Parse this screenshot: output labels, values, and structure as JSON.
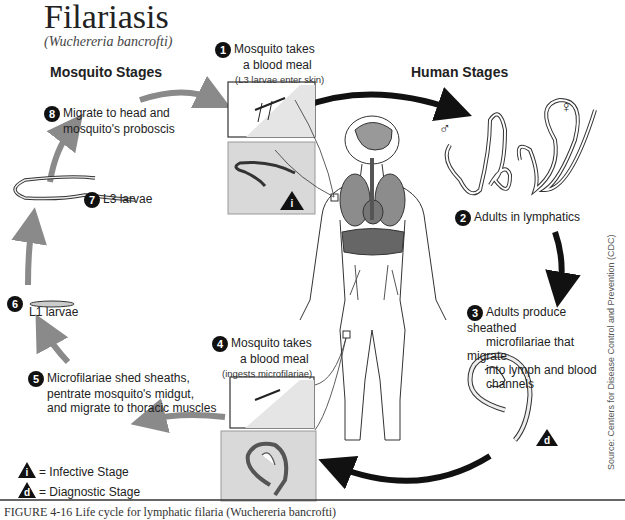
{
  "header": {
    "title": "Filariasis",
    "subtitle": "(Wuchereria bancrofti)"
  },
  "sections": {
    "mosquito": "Mosquito Stages",
    "human": "Human Stages"
  },
  "steps": [
    {
      "num": "1",
      "line1": "Mosquito takes",
      "line2": "a blood meal",
      "note": "(L3 larvae enter skin)"
    },
    {
      "num": "2",
      "line1": "Adults in lymphatics"
    },
    {
      "num": "3",
      "line1": "Adults produce sheathed",
      "line2": "microfilariae that migrate",
      "line3": "into lymph and blood",
      "line4": "channels"
    },
    {
      "num": "4",
      "line1": "Mosquito takes",
      "line2": "a blood meal",
      "note": "(ingests microfilariae)"
    },
    {
      "num": "5",
      "line1": "Microfilariae shed sheaths,",
      "line2": "pentrate mosquito's midgut,",
      "line3": "and migrate to thoracic muscles"
    },
    {
      "num": "6",
      "line1": "L1 larvae"
    },
    {
      "num": "7",
      "line1": "L3 larvae"
    },
    {
      "num": "8",
      "line1": "Migrate to head and",
      "line2": "mosquito's proboscis"
    }
  ],
  "legend": {
    "infective_symbol": "i",
    "infective_label": "= Infective Stage",
    "diagnostic_symbol": "d",
    "diagnostic_label": "= Diagnostic Stage"
  },
  "sex_symbols": {
    "male": "♂",
    "female": "♀"
  },
  "source": "Source: Centers for Disease Control and Prevention (CDC)",
  "caption": "FIGURE 4-16 Life cycle for lymphatic filaria (Wuchereria bancrofti)",
  "colors": {
    "gray_arrow": "#8a8a8a",
    "black_arrow": "#111111",
    "panel_fill": "#d9d9d9",
    "organ": "#8c8c8c"
  }
}
